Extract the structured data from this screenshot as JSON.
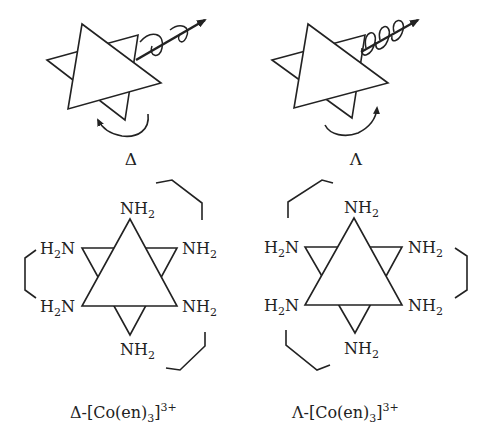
{
  "figure": {
    "top_left": {
      "symbol": "Δ",
      "helix_handedness": "left-handed"
    },
    "top_right": {
      "symbol": "Λ",
      "helix_handedness": "right-handed"
    },
    "ligand_label_main": "NH",
    "ligand_label_sub": "2",
    "ligand_label_left_main1": "H",
    "ligand_label_left_sub": "2",
    "ligand_label_left_main2": "N",
    "bottom_left": {
      "caption_prefix": "Δ-[Co(en)",
      "caption_sub": "3",
      "caption_close": "]",
      "caption_sup": "3+"
    },
    "bottom_right": {
      "caption_prefix": "Λ-[Co(en)",
      "caption_sub": "3",
      "caption_close": "]",
      "caption_sup": "3+"
    }
  }
}
